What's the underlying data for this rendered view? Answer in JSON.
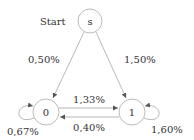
{
  "diagram": {
    "type": "state-machine",
    "start_label": "Start",
    "nodes": [
      {
        "id": "s",
        "label": "s",
        "cx": 90,
        "cy": 21,
        "r": 12
      },
      {
        "id": "0",
        "label": "0",
        "cx": 46,
        "cy": 112,
        "r": 13
      },
      {
        "id": "1",
        "label": "1",
        "cx": 132,
        "cy": 112,
        "r": 13
      }
    ],
    "edges": [
      {
        "from": "s",
        "to": "0",
        "label": "0,50%"
      },
      {
        "from": "s",
        "to": "1",
        "label": "1,50%"
      },
      {
        "from": "0",
        "to": "1",
        "label": "1,33%"
      },
      {
        "from": "1",
        "to": "0",
        "label": "0,40%"
      },
      {
        "from": "0",
        "to": "0",
        "label": "0,67%"
      },
      {
        "from": "1",
        "to": "1",
        "label": "1,60%"
      }
    ],
    "colors": {
      "stroke": "#999999",
      "text": "#333333"
    }
  }
}
